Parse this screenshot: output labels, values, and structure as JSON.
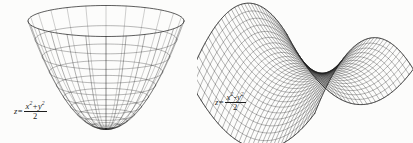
{
  "page": {
    "background_color": "#fcfcfb",
    "ink_color": "#1d1d1d",
    "width": 413,
    "height": 143
  },
  "figures": [
    {
      "id": "paraboloid",
      "name": "elliptic-paraboloid",
      "equation": {
        "lhs": "z",
        "equals": "=",
        "numerator_parts": [
          "x",
          "2",
          "+",
          "y",
          "2"
        ],
        "numerator_text": "x² + y²",
        "denominator": "2",
        "full_text": "z = (x² + y²)/2"
      }
    },
    {
      "id": "saddle",
      "name": "hyperbolic-paraboloid",
      "equation": {
        "lhs": "z",
        "equals": "=",
        "numerator_parts": [
          "x",
          "2",
          "-",
          "y",
          "2"
        ],
        "numerator_text": "x² - y²",
        "denominator": "2",
        "full_text": "z = (x² - y²)/2"
      }
    }
  ],
  "chart_data": [
    {
      "type": "surface",
      "id": "paraboloid",
      "title": "",
      "equation": "z = (x^2 + y^2)/2",
      "surface_kind": "elliptic-paraboloid",
      "mesh": {
        "radial_lines": 24,
        "ring_lines": 11,
        "style": "wireframe"
      },
      "domain": {
        "r_max": 2.0,
        "theta": [
          0,
          6.283185307
        ]
      },
      "zlim": [
        0,
        2.0
      ],
      "projection": {
        "kind": "oblique",
        "elevation_deg": 22,
        "azimuth_deg": 0
      },
      "grid": true,
      "legend": false,
      "xlabel": "",
      "ylabel": "",
      "zlabel": "",
      "annotations": [
        {
          "text": "z = (x² + y²)/2",
          "x": 14,
          "y": 101
        }
      ]
    },
    {
      "type": "surface",
      "id": "saddle",
      "title": "",
      "equation": "z = (x^2 - y^2)/2",
      "surface_kind": "hyperbolic-paraboloid",
      "mesh": {
        "u_lines": 31,
        "v_lines": 31,
        "style": "wireframe"
      },
      "domain": {
        "x": [
          -1.6,
          1.6
        ],
        "y": [
          -1.6,
          1.6
        ]
      },
      "zlim": [
        -1.28,
        1.28
      ],
      "projection": {
        "kind": "oblique",
        "elevation_deg": 20,
        "azimuth_deg": 38
      },
      "grid": true,
      "legend": false,
      "xlabel": "",
      "ylabel": "",
      "zlabel": "",
      "annotations": [
        {
          "text": "z = (x² - y²)/2",
          "x": 215,
          "y": 92
        }
      ]
    }
  ]
}
